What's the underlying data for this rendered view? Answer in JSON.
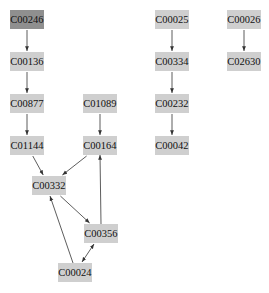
{
  "graph": {
    "nodes": [
      {
        "id": "C00246",
        "label": "C00246",
        "highlight": true
      },
      {
        "id": "C00136",
        "label": "C00136",
        "highlight": false
      },
      {
        "id": "C00877",
        "label": "C00877",
        "highlight": false
      },
      {
        "id": "C01144",
        "label": "C01144",
        "highlight": false
      },
      {
        "id": "C01089",
        "label": "C01089",
        "highlight": false
      },
      {
        "id": "C00164",
        "label": "C00164",
        "highlight": false
      },
      {
        "id": "C00332",
        "label": "C00332",
        "highlight": false
      },
      {
        "id": "C00356",
        "label": "C00356",
        "highlight": false
      },
      {
        "id": "C00024",
        "label": "C00024",
        "highlight": false
      },
      {
        "id": "C00025",
        "label": "C00025",
        "highlight": false
      },
      {
        "id": "C00334",
        "label": "C00334",
        "highlight": false
      },
      {
        "id": "C00232",
        "label": "C00232",
        "highlight": false
      },
      {
        "id": "C00042",
        "label": "C00042",
        "highlight": false
      },
      {
        "id": "C00026",
        "label": "C00026",
        "highlight": false
      },
      {
        "id": "C02630",
        "label": "C02630",
        "highlight": false
      }
    ],
    "edges": [
      {
        "from": "C00246",
        "to": "C00136",
        "bidirectional": false
      },
      {
        "from": "C00136",
        "to": "C00877",
        "bidirectional": false
      },
      {
        "from": "C00877",
        "to": "C01144",
        "bidirectional": false
      },
      {
        "from": "C01089",
        "to": "C00164",
        "bidirectional": false
      },
      {
        "from": "C01144",
        "to": "C00332",
        "bidirectional": false
      },
      {
        "from": "C00164",
        "to": "C00332",
        "bidirectional": false
      },
      {
        "from": "C00332",
        "to": "C00356",
        "bidirectional": false
      },
      {
        "from": "C00356",
        "to": "C00164",
        "bidirectional": false
      },
      {
        "from": "C00024",
        "to": "C00332",
        "bidirectional": false
      },
      {
        "from": "C00356",
        "to": "C00024",
        "bidirectional": true
      },
      {
        "from": "C00025",
        "to": "C00334",
        "bidirectional": false
      },
      {
        "from": "C00334",
        "to": "C00232",
        "bidirectional": false
      },
      {
        "from": "C00232",
        "to": "C00042",
        "bidirectional": false
      },
      {
        "from": "C00026",
        "to": "C02630",
        "bidirectional": false
      }
    ],
    "colors": {
      "node_fill": "#cfcfcf",
      "highlight_fill": "#8f8f8f",
      "edge": "#333333",
      "text": "#111111"
    }
  }
}
